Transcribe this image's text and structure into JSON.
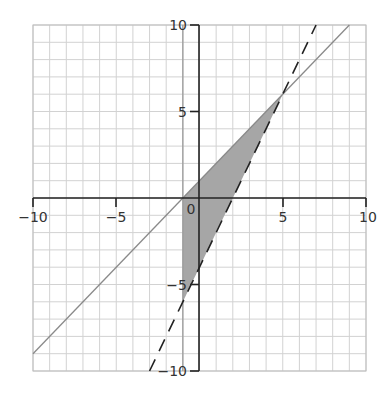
{
  "chart_data": {
    "type": "line",
    "title": "",
    "xlabel": "",
    "ylabel": "",
    "xlim": [
      -10,
      10
    ],
    "ylim": [
      -10,
      10
    ],
    "grid": true,
    "grid_step": 1,
    "x_ticks": [
      -10,
      -5,
      0,
      5,
      10
    ],
    "y_ticks": [
      -10,
      -5,
      5,
      10
    ],
    "tick_labels": {
      "x_neg10": "−10",
      "x_neg5": "−5",
      "origin": "0",
      "x_5": "5",
      "x_10": "10",
      "y_10": "10",
      "y_5": "5",
      "y_neg5": "−5",
      "y_neg10": "−10"
    },
    "series": [
      {
        "name": "y = x + 1",
        "style": "solid",
        "color": "#8a8a8a",
        "x": [
          -10,
          9
        ],
        "y": [
          -9,
          10
        ]
      },
      {
        "name": "y = 2x - 4",
        "style": "dashed",
        "color": "#222222",
        "x": [
          -3,
          7
        ],
        "y": [
          -10,
          10
        ]
      },
      {
        "name": "x = -1",
        "style": "solid",
        "color": "#9a9a9a",
        "x": [
          -1,
          -1
        ],
        "y": [
          -10,
          10
        ]
      }
    ],
    "shaded_region": {
      "description": "feasible triangle",
      "vertices": [
        [
          -1,
          0
        ],
        [
          5,
          6
        ],
        [
          -1,
          -6
        ]
      ],
      "color": "#a6a6a6"
    },
    "colors": {
      "grid": "#d2d2d2",
      "axis": "#222222",
      "shade": "#a6a6a6"
    }
  }
}
